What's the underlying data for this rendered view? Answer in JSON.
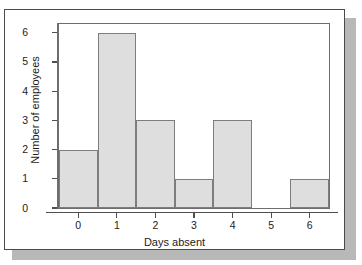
{
  "chart_data": {
    "type": "bar",
    "title": "",
    "subtitle": "",
    "xlabel": "Days absent",
    "ylabel": "Number of employees",
    "categories": [
      "0",
      "1",
      "2",
      "3",
      "4",
      "5",
      "6"
    ],
    "values": [
      2,
      6,
      3,
      1,
      3,
      0,
      1
    ],
    "series": [
      {
        "name": "Number of employees",
        "values": [
          2,
          6,
          3,
          1,
          3,
          0,
          1
        ]
      }
    ],
    "xtick_labels": [
      "0",
      "1",
      "2",
      "3",
      "4",
      "5",
      "6"
    ],
    "ytick_labels": [
      "0",
      "1",
      "2",
      "3",
      "4",
      "5",
      "6"
    ],
    "ylim": [
      0,
      6.3
    ],
    "xlim": [
      -0.5,
      6.5
    ],
    "grid": false,
    "legend": false,
    "legend_position": "none",
    "bar_fill_color": "#dedede",
    "bar_edge_color": "#7d7d7d",
    "axis_color": "#4f4f4f",
    "frame_color": "#6d6d6d",
    "text_color": "#1c1c1c",
    "background_color": "#ffffff",
    "annotations": []
  },
  "figure": {
    "card_background": "#ffffff",
    "card_border_color": "#4a4a4a",
    "shadow_color": "#b8b8b8"
  }
}
